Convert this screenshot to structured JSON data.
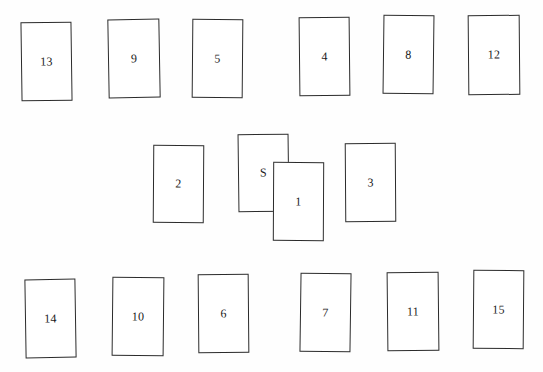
{
  "diagram": {
    "background_color": "#fefefe",
    "card_fill_color": "#ffffff",
    "card_border_color": "#2b2b2b",
    "label_color": "#1a1a1a",
    "rows": [
      {
        "name": "top-row",
        "card_labels": [
          "13",
          "9",
          "5",
          "4",
          "8",
          "12"
        ]
      },
      {
        "name": "middle-row",
        "card_labels": [
          "2",
          "S",
          "1",
          "3"
        ]
      },
      {
        "name": "bottom-row",
        "card_labels": [
          "14",
          "10",
          "6",
          "7",
          "11",
          "15"
        ]
      }
    ],
    "cards": [
      {
        "id": "card-13",
        "label": "13",
        "row": "top",
        "x": 21,
        "y": 22,
        "w": 51,
        "h": 79,
        "rotate": -0.8,
        "z": 1
      },
      {
        "id": "card-9",
        "label": "9",
        "row": "top",
        "x": 108,
        "y": 19,
        "w": 52,
        "h": 79,
        "rotate": -1.0,
        "z": 1
      },
      {
        "id": "card-5",
        "label": "5",
        "row": "top",
        "x": 192,
        "y": 19,
        "w": 51,
        "h": 79,
        "rotate": 0.5,
        "z": 1
      },
      {
        "id": "card-4",
        "label": "4",
        "row": "top",
        "x": 299,
        "y": 17,
        "w": 51,
        "h": 79,
        "rotate": -0.6,
        "z": 1
      },
      {
        "id": "card-8",
        "label": "8",
        "row": "top",
        "x": 383,
        "y": 15,
        "w": 51,
        "h": 79,
        "rotate": 0.7,
        "z": 1
      },
      {
        "id": "card-12",
        "label": "12",
        "row": "top",
        "x": 468,
        "y": 15,
        "w": 52,
        "h": 80,
        "rotate": -0.5,
        "z": 1
      },
      {
        "id": "card-2",
        "label": "2",
        "row": "middle",
        "x": 153,
        "y": 145,
        "w": 51,
        "h": 78,
        "rotate": 0.4,
        "z": 1
      },
      {
        "id": "card-S",
        "label": "S",
        "row": "middle",
        "x": 238,
        "y": 134,
        "w": 51,
        "h": 78,
        "rotate": -0.7,
        "z": 1
      },
      {
        "id": "card-1",
        "label": "1",
        "row": "middle",
        "x": 273,
        "y": 162,
        "w": 51,
        "h": 79,
        "rotate": 0.3,
        "z": 3
      },
      {
        "id": "card-3",
        "label": "3",
        "row": "middle",
        "x": 345,
        "y": 143,
        "w": 51,
        "h": 79,
        "rotate": -0.4,
        "z": 1
      },
      {
        "id": "card-14",
        "label": "14",
        "row": "bottom",
        "x": 25,
        "y": 279,
        "w": 51,
        "h": 79,
        "rotate": -0.9,
        "z": 1
      },
      {
        "id": "card-10",
        "label": "10",
        "row": "bottom",
        "x": 112,
        "y": 277,
        "w": 52,
        "h": 79,
        "rotate": 0.6,
        "z": 1
      },
      {
        "id": "card-6",
        "label": "6",
        "row": "bottom",
        "x": 198,
        "y": 274,
        "w": 51,
        "h": 79,
        "rotate": -0.5,
        "z": 1
      },
      {
        "id": "card-7",
        "label": "7",
        "row": "bottom",
        "x": 300,
        "y": 273,
        "w": 51,
        "h": 79,
        "rotate": 0.8,
        "z": 1
      },
      {
        "id": "card-11",
        "label": "11",
        "row": "bottom",
        "x": 387,
        "y": 272,
        "w": 52,
        "h": 79,
        "rotate": -0.6,
        "z": 1
      },
      {
        "id": "card-15",
        "label": "15",
        "row": "bottom",
        "x": 473,
        "y": 270,
        "w": 51,
        "h": 79,
        "rotate": 0.5,
        "z": 1
      }
    ]
  }
}
